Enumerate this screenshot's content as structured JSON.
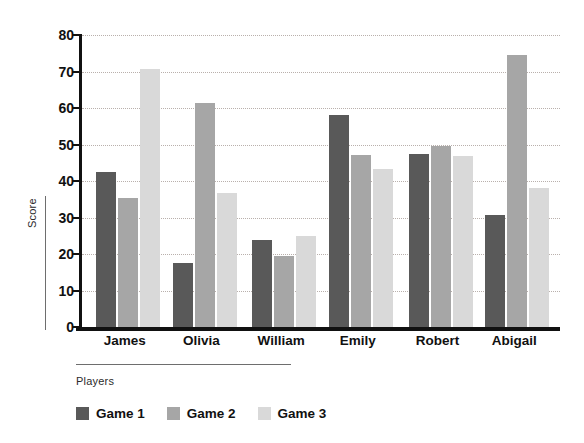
{
  "chart_data": {
    "type": "bar",
    "title": "",
    "xlabel": "Players",
    "ylabel": "Score",
    "categories": [
      "James",
      "Olivia",
      "William",
      "Emily",
      "Robert",
      "Abigail"
    ],
    "series": [
      {
        "name": "Game 1",
        "color": "#595959",
        "values": [
          42.5,
          17.5,
          23.8,
          58.0,
          47.3,
          30.7
        ]
      },
      {
        "name": "Game 2",
        "color": "#a6a6a6",
        "values": [
          35.4,
          61.5,
          19.5,
          47.2,
          49.7,
          74.5
        ]
      },
      {
        "name": "Game 3",
        "color": "#d9d9d9",
        "values": [
          70.8,
          36.8,
          25.0,
          43.4,
          46.9,
          38.2
        ]
      }
    ],
    "ylim": [
      0,
      80
    ],
    "yticks": [
      0,
      10,
      20,
      30,
      40,
      50,
      60,
      70,
      80
    ],
    "ytick_labels": [
      "0",
      "10",
      "20",
      "30",
      "40",
      "50",
      "60",
      "70",
      "80"
    ],
    "grid": true,
    "grid_style": "dotted",
    "legend_position": "bottom-left",
    "axis_color": "#111111",
    "grid_color": "#b9b0ac",
    "background": "#ffffff"
  },
  "legend": {
    "items": [
      {
        "label": "Game 1",
        "color": "#595959"
      },
      {
        "label": "Game 2",
        "color": "#a6a6a6"
      },
      {
        "label": "Game 3",
        "color": "#d9d9d9"
      }
    ]
  }
}
